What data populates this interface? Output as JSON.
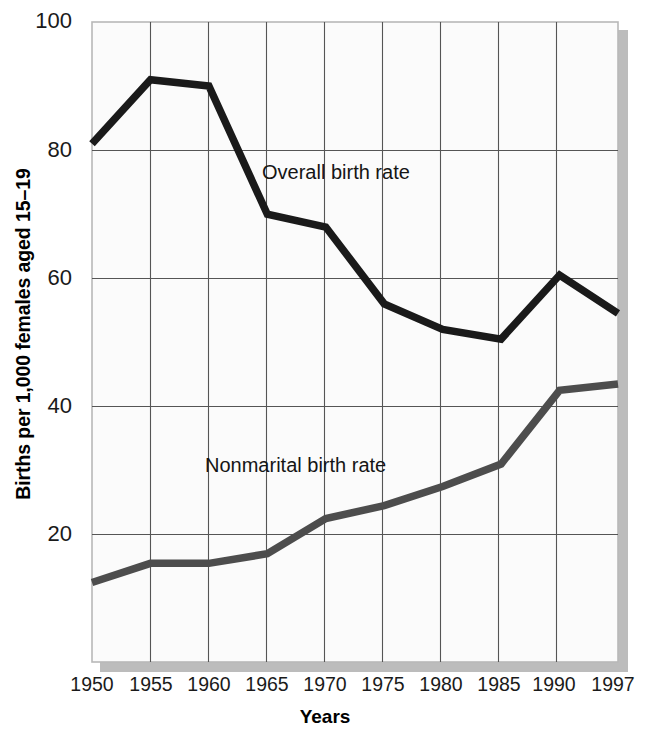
{
  "chart_data": {
    "type": "line",
    "title": "",
    "xlabel": "Years",
    "ylabel": "Births per 1,000 females aged 15–19",
    "x": [
      1950,
      1955,
      1960,
      1965,
      1970,
      1975,
      1980,
      1985,
      1990,
      1997
    ],
    "xtick_labels": [
      "1950",
      "1955",
      "1960",
      "1965",
      "1970",
      "1975",
      "1980",
      "1985",
      "1990",
      "1997"
    ],
    "ytick_labels": [
      "100",
      "80",
      "60",
      "40",
      "20"
    ],
    "yticks": [
      100,
      80,
      60,
      40,
      20
    ],
    "ylim": [
      0,
      100
    ],
    "xlim": [
      1950,
      1997
    ],
    "grid": true,
    "legend_position": "inline-annotations",
    "series": [
      {
        "name": "Overall birth rate",
        "color": "#1a1a1a",
        "values": [
          81,
          91,
          90,
          70,
          68,
          56,
          52,
          50.5,
          60.5,
          54.5
        ]
      },
      {
        "name": "Nonmarital birth rate",
        "color": "#4d4d4d",
        "values": [
          12.5,
          15.5,
          15.5,
          17,
          22.5,
          24.5,
          27.5,
          31,
          42.5,
          43.5
        ]
      }
    ],
    "annotations": [
      {
        "text": "Overall birth rate",
        "x": 1964.7,
        "y": 74.5
      },
      {
        "text": "Nonmarital birth rate",
        "x": 1959.6,
        "y": 32.5
      }
    ]
  },
  "axes": {
    "ylabel": "Births per 1,000 females aged 15–19",
    "xlabel": "Years"
  }
}
